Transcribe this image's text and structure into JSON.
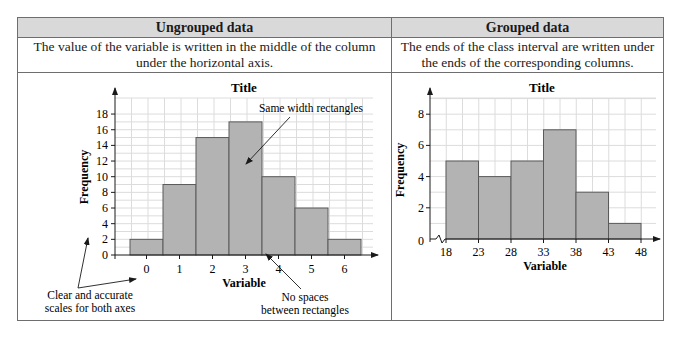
{
  "table": {
    "columns": [
      {
        "header": "Ungrouped data",
        "description_line1": "The value of the variable is written in the middle of the column",
        "description_line2": "under the horizontal axis."
      },
      {
        "header": "Grouped data",
        "description_line1": "The ends of the class interval are written under",
        "description_line2": "the ends of the corresponding columns."
      }
    ]
  },
  "annotations": {
    "same_width": "Same width rectangles",
    "scales_line1": "Clear and accurate",
    "scales_line2": "scales for both axes",
    "no_spaces_line1": "No spaces",
    "no_spaces_line2": "between rectangles"
  },
  "chart_data": [
    {
      "type": "bar",
      "subtype": "histogram-ungrouped",
      "title": "Title",
      "xlabel": "Variable",
      "ylabel": "Frequency",
      "categories": [
        "0",
        "1",
        "2",
        "3",
        "4",
        "5",
        "6"
      ],
      "values": [
        2,
        9,
        15,
        17,
        10,
        6,
        2
      ],
      "yticks": [
        0,
        2,
        4,
        6,
        8,
        10,
        12,
        14,
        16,
        18
      ],
      "ylim": [
        0,
        19
      ],
      "grid": true,
      "bar_color": "#b3b3b3"
    },
    {
      "type": "bar",
      "subtype": "histogram-grouped",
      "title": "Title",
      "xlabel": "Variable",
      "ylabel": "Frequency",
      "bin_edges": [
        18,
        23,
        28,
        33,
        38,
        43,
        48
      ],
      "values": [
        5,
        4,
        5,
        7,
        3,
        1
      ],
      "yticks": [
        0,
        2,
        4,
        6,
        8
      ],
      "ylim": [
        0,
        9
      ],
      "axis_break": true,
      "grid": true,
      "bar_color": "#b3b3b3"
    }
  ]
}
